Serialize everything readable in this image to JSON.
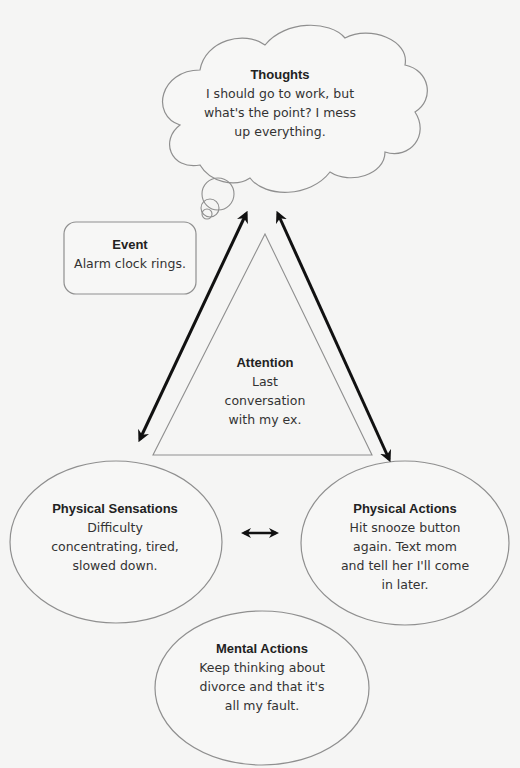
{
  "diagram": {
    "thoughts": {
      "title": "Thoughts",
      "text": "I should go to work, but what's the point? I mess up everything."
    },
    "event": {
      "title": "Event",
      "text": "Alarm clock rings."
    },
    "attention": {
      "title": "Attention",
      "text": "Last conversation with my ex."
    },
    "physical_sensations": {
      "title": "Physical Sensations",
      "text": "Difficulty concentrating, tired, slowed down."
    },
    "physical_actions": {
      "title": "Physical Actions",
      "text": "Hit snooze button again. Text mom and tell her I'll come in later."
    },
    "mental_actions": {
      "title": "Mental Actions",
      "text": "Keep thinking about divorce and that it's all my fault."
    },
    "colors": {
      "background": "#f5f5f4",
      "outline": "#8a8a8a",
      "arrow": "#111111"
    }
  }
}
